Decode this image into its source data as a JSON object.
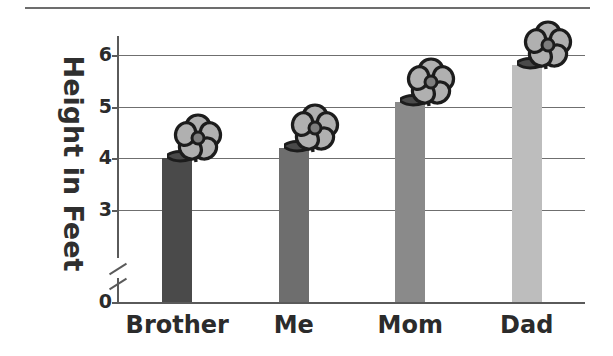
{
  "chart_data": {
    "type": "bar",
    "title": "",
    "subtitle": "",
    "xlabel": "",
    "ylabel": "Height in Feet",
    "categories": [
      "Brother",
      "Me",
      "Mom",
      "Dad"
    ],
    "values": [
      4.0,
      4.2,
      5.1,
      5.8
    ],
    "ylim": [
      0,
      6.4
    ],
    "ytick_labels": [
      "0",
      "3",
      "4",
      "5",
      "6"
    ],
    "ytick_values": [
      0,
      3,
      4,
      5,
      6
    ],
    "gridlines": [
      3,
      4,
      5,
      6
    ],
    "grid": true,
    "axis_break": true,
    "axis_break_between": [
      0,
      3
    ],
    "legend": "none",
    "bar_colors": [
      "#4a4a4a",
      "#6e6e6e",
      "#8a8a8a",
      "#bdbdbd"
    ],
    "decoration": "flower-on-top-of-each-bar",
    "series": [
      {
        "name": "Height",
        "values": [
          4.0,
          4.2,
          5.1,
          5.8
        ]
      }
    ]
  },
  "colors": {
    "axis": "#5a5a5a",
    "grid": "#6f6f6f",
    "text": "#2b2b2b",
    "rule": "#6d6d6d",
    "flower_petal": "#b0b0b0",
    "flower_outline": "#1c1c1c",
    "flower_center": "#7d7d7d",
    "leaf": "#4a4a4a"
  },
  "icons": {
    "flower": "flower-icon",
    "leaf": "leaf-icon"
  }
}
